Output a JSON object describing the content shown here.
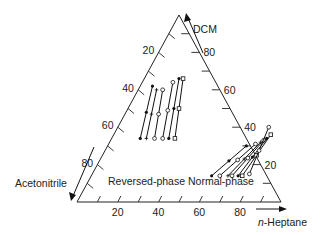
{
  "chart_data": {
    "type": "scatter",
    "subtype": "ternary",
    "title": "",
    "vertices": {
      "top": "DCM",
      "bottom_left": "Acetonitrile",
      "bottom_right": "n-Heptane"
    },
    "axis_labels": {
      "dcm": "DCM",
      "acetonitrile": "Acetonitrile",
      "heptane_italic_prefix": "n",
      "heptane_rest": "-Heptane"
    },
    "tick_step": 10,
    "tick_labels": {
      "acetonitrile": [
        "20",
        "40",
        "60",
        "80"
      ],
      "dcm": [
        "80",
        "60",
        "40",
        "20"
      ],
      "heptane": [
        "20",
        "40",
        "60",
        "80"
      ]
    },
    "region_labels": [
      "Reversed-phase",
      "Normal-phase"
    ],
    "series": [
      {
        "name": "Reversed-phase",
        "units": "% composition (heptane, dcm)",
        "lines": [
          {
            "from": [
              6,
              62
            ],
            "to": [
              14,
              34
            ],
            "marker": "filled"
          },
          {
            "from": [
              9,
              60
            ],
            "to": [
              17,
              34
            ],
            "marker": "plus"
          },
          {
            "from": [
              12,
              60
            ],
            "to": [
              21,
              34
            ],
            "marker": "open-circle"
          },
          {
            "from": [
              15,
              64
            ],
            "to": [
              25,
              34
            ],
            "marker": "open-circle"
          },
          {
            "from": [
              17,
              66
            ],
            "to": [
              28,
              34
            ],
            "marker": "filled"
          },
          {
            "from": [
              19,
              66
            ],
            "to": [
              31,
              34
            ],
            "marker": "open-square"
          }
        ]
      },
      {
        "name": "Normal-phase",
        "units": "% composition (heptane, dcm)",
        "lines": [
          {
            "from": [
              68,
              30
            ],
            "to": [
              59,
              14
            ],
            "marker": "filled"
          },
          {
            "from": [
              72,
              31
            ],
            "to": [
              63,
              14
            ],
            "marker": "open-circle"
          },
          {
            "from": [
              74,
              32
            ],
            "to": [
              67,
              14
            ],
            "marker": "plus"
          },
          {
            "from": [
              75,
              33
            ],
            "to": [
              69,
              14
            ],
            "marker": "open-circle"
          },
          {
            "from": [
              76,
              34
            ],
            "to": [
              72,
              14
            ],
            "marker": "filled"
          },
          {
            "from": [
              77,
              36
            ],
            "to": [
              74,
              14
            ],
            "marker": "open-square"
          },
          {
            "from": [
              74,
              40
            ],
            "to": [
              77,
              15
            ],
            "marker": "open-circle"
          }
        ]
      }
    ]
  }
}
